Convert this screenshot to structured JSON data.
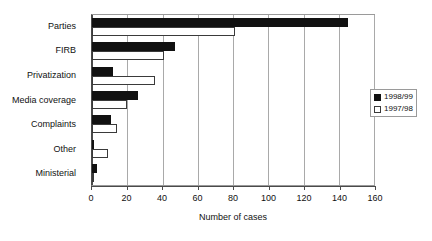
{
  "chart_data": {
    "type": "bar",
    "orientation": "horizontal",
    "title": "",
    "xlabel": "Number of cases",
    "ylabel": "",
    "xlim": [
      0,
      160
    ],
    "xticks": [
      0,
      20,
      40,
      60,
      80,
      100,
      120,
      140,
      160
    ],
    "grid": true,
    "legend_position": "right",
    "categories": [
      "Parties",
      "FIRB",
      "Privatization",
      "Media coverage",
      "Complaints",
      "Other",
      "Ministerial"
    ],
    "series": [
      {
        "name": "1998/99",
        "color": "#111111",
        "values": [
          145,
          47,
          12,
          26,
          11,
          1,
          3
        ]
      },
      {
        "name": "1997/98",
        "color": "#ffffff",
        "values": [
          81,
          41,
          36,
          20,
          14,
          9,
          1
        ]
      }
    ]
  },
  "legend": {
    "items": [
      {
        "label": "1998/99",
        "swatch": "filled-square-icon"
      },
      {
        "label": "1997/98",
        "swatch": "empty-square-icon"
      }
    ]
  }
}
